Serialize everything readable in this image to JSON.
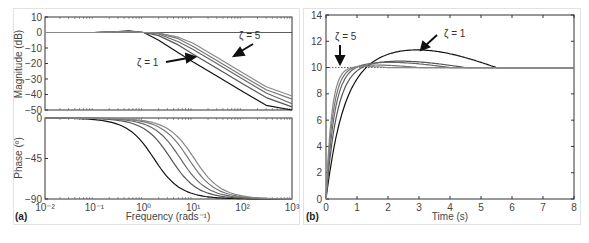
{
  "chart_data": [
    {
      "id": "a",
      "panel_label": "(a)",
      "type": "line",
      "subplots": [
        {
          "name": "magnitude",
          "ylabel": "Magnitude (dB)",
          "xscale": "log",
          "xlim": [
            0.01,
            1000
          ],
          "ylim": [
            -50,
            10
          ],
          "yticks": [
            10,
            0,
            -10,
            -20,
            -30,
            -40,
            -50
          ],
          "grid": false,
          "series": [
            {
              "name": "ζ = 1",
              "x": [
                0.01,
                0.1,
                0.3,
                0.5,
                1,
                2,
                5,
                10,
                30,
                100,
                300,
                1000
              ],
              "y": [
                0,
                0,
                0.5,
                1,
                0,
                -5,
                -13,
                -19,
                -28,
                -38,
                -47,
                -50
              ]
            },
            {
              "name": "ζ = 2",
              "x": [
                0.01,
                0.1,
                0.5,
                1,
                2,
                5,
                10,
                30,
                100,
                300,
                1000
              ],
              "y": [
                0,
                0,
                0.5,
                0,
                -2,
                -8,
                -14,
                -23,
                -33,
                -42,
                -48
              ]
            },
            {
              "name": "ζ = 3",
              "x": [
                0.01,
                0.1,
                0.5,
                1,
                2,
                5,
                10,
                30,
                100,
                300,
                1000
              ],
              "y": [
                0,
                0,
                0.5,
                0,
                -1,
                -6,
                -11,
                -20,
                -30,
                -39,
                -46
              ]
            },
            {
              "name": "ζ = 4",
              "x": [
                0.01,
                0.1,
                0.5,
                1,
                2,
                5,
                10,
                30,
                100,
                300,
                1000
              ],
              "y": [
                0,
                0,
                0.5,
                0,
                -0.5,
                -4,
                -9,
                -18,
                -28,
                -37,
                -43
              ]
            },
            {
              "name": "ζ = 5",
              "x": [
                0.01,
                0.1,
                0.5,
                1,
                2,
                5,
                10,
                30,
                100,
                300,
                1000
              ],
              "y": [
                0,
                0,
                0.5,
                0,
                -0.3,
                -3,
                -7,
                -16,
                -26,
                -35,
                -41
              ]
            }
          ],
          "annotations": [
            {
              "text": "ζ = 5",
              "x": 100,
              "y": -6,
              "arrow_to": [
                40,
                -17
              ]
            },
            {
              "text": "ζ = 1",
              "x": 0.5,
              "y": -20,
              "arrow_to": [
                3,
                -16
              ]
            }
          ]
        },
        {
          "name": "phase",
          "ylabel": "Phase (º)",
          "xlabel": "Frequency (rads⁻¹)",
          "xscale": "log",
          "xlim": [
            0.01,
            1000
          ],
          "ylim": [
            -90,
            0
          ],
          "yticks": [
            0,
            -45,
            -90
          ],
          "xticks": [
            "10⁻²",
            "10⁻¹",
            "10⁰",
            "10¹",
            "10²",
            "10³"
          ],
          "grid": false,
          "series": [
            {
              "name": "ζ = 1",
              "wc": 1.6
            },
            {
              "name": "ζ = 2",
              "wc": 3.5
            },
            {
              "name": "ζ = 3",
              "wc": 5.5
            },
            {
              "name": "ζ = 4",
              "wc": 8
            },
            {
              "name": "ζ = 5",
              "wc": 10.5
            }
          ]
        }
      ]
    },
    {
      "id": "b",
      "panel_label": "(b)",
      "type": "line",
      "xlabel": "Time (s)",
      "ylabel": "",
      "xlim": [
        0,
        8
      ],
      "ylim": [
        0,
        14
      ],
      "xticks": [
        0,
        1,
        2,
        3,
        4,
        5,
        6,
        7,
        8
      ],
      "yticks": [
        0,
        2,
        4,
        6,
        8,
        10,
        12,
        14
      ],
      "reference_line": {
        "y": 10,
        "style": "dotted"
      },
      "grid": false,
      "series": [
        {
          "name": "ζ = 1",
          "peak": 11.4,
          "peak_time": 2.0,
          "settle_time": 5.5
        },
        {
          "name": "ζ = 2",
          "peak": 10.5,
          "peak_time": 1.4,
          "settle_time": 4.5
        },
        {
          "name": "ζ = 3",
          "peak": 10.4,
          "peak_time": 1.0,
          "settle_time": 4.0
        },
        {
          "name": "ζ = 4",
          "peak": 10.2,
          "peak_time": 0.8,
          "settle_time": 3.0
        },
        {
          "name": "ζ = 5",
          "peak": 10.1,
          "peak_time": 0.6,
          "settle_time": 2.0
        }
      ],
      "annotations": [
        {
          "text": "ζ = 5",
          "x": 0.2,
          "y": 12.2,
          "arrow_to": [
            0.4,
            10.2
          ]
        },
        {
          "text": "ζ = 1",
          "x": 3.8,
          "y": 13.0,
          "arrow_to": [
            3.1,
            11.2
          ]
        }
      ]
    }
  ],
  "labels": {
    "mag_ylabel": "Magnitude (dB)",
    "phase_ylabel": "Phase (º)",
    "freq_xlabel": "Frequency (rads⁻¹)",
    "time_xlabel": "Time (s)",
    "panel_a": "(a)",
    "panel_b": "(b)",
    "zeta5": "ζ = 5",
    "zeta1": "ζ = 1"
  }
}
